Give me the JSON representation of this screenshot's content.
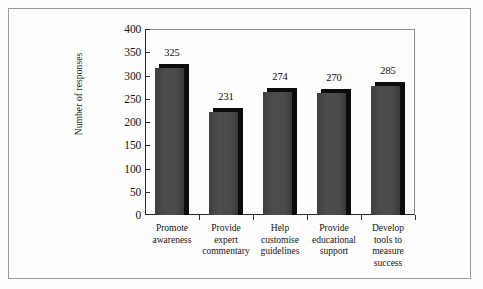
{
  "chart_data": {
    "type": "bar",
    "title": "",
    "xlabel": "",
    "ylabel": "Number of responses",
    "ylim": [
      0,
      400
    ],
    "ytick_step": 50,
    "yticks": [
      "400",
      "350",
      "300",
      "250",
      "200",
      "150",
      "100",
      "50",
      "0"
    ],
    "grid": false,
    "legend": "none",
    "style": "3d-bar",
    "categories": [
      "Promote awareness",
      "Provide expert commentary",
      "Help customise guidelines",
      "Provide educational support",
      "Develop tools to measure success"
    ],
    "category_lines": [
      [
        "Promote",
        "awareness"
      ],
      [
        "Provide",
        "expert",
        "commentary"
      ],
      [
        "Help",
        "customise",
        "guidelines"
      ],
      [
        "Provide",
        "educational",
        "support"
      ],
      [
        "Develop",
        "tools to",
        "measure",
        "success"
      ]
    ],
    "values": [
      325,
      231,
      274,
      270,
      285
    ],
    "value_labels": [
      "325",
      "231",
      "274",
      "270",
      "285"
    ]
  },
  "colors": {
    "bar_face": "#4a4a4a",
    "bar_shadow": "#0c0c0c",
    "axis": "#2a2a2a",
    "background": "#fdfdfd",
    "frame": "#9a9a9a",
    "text": "#141414"
  }
}
